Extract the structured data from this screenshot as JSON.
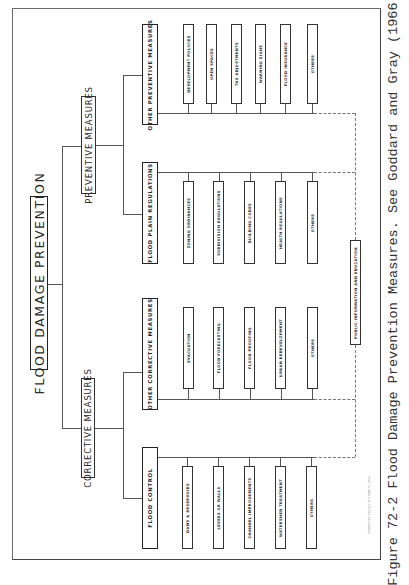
{
  "diagram": {
    "root": {
      "label": "FLOOD DAMAGE PREVENTION"
    },
    "branches": [
      {
        "label": "PREVENTIVE MEASURES",
        "groups": [
          {
            "label": "OTHER PREVENTIVE MEASURES",
            "items": [
              "DEVELOPMENT POLICIES",
              "OPEN SPACES",
              "TAX ADJUSTMENTS",
              "WARNING SIGNS",
              "FLOOD INSURANCE",
              "OTHERS"
            ]
          },
          {
            "label": "FLOOD PLAIN REGULATIONS",
            "items": [
              "ZONING ORDINANCES",
              "SUBDIVISION REGULATIONS",
              "BUILDING CODES",
              "HEALTH REGULATIONS",
              "OTHERS"
            ]
          }
        ]
      },
      {
        "label": "CORRECTIVE MEASURES",
        "groups": [
          {
            "label": "OTHER CORRECTIVE MEASURES",
            "items": [
              "EVACUATION",
              "FLOOD FORECASTING",
              "FLOOD PROOFING",
              "URBAN REDEVELOPMENT",
              "OTHERS"
            ]
          },
          {
            "label": "FLOOD CONTROL",
            "items": [
              "DAMS & RESERVOIRS",
              "LEVEES OR WALLS",
              "CHANNEL IMPROVEMENTS",
              "WATERSHED TREATMENT",
              "OTHERS"
            ]
          }
        ]
      }
    ],
    "shared_node": {
      "label": "PUBLIC INFORMATION AND EDUCATION"
    },
    "credit": "TENNESSEE VALLEY AUTHORITY 1966"
  },
  "caption": "Figure 72-2  Flood Damage Prevention Measures.  See Goddard and Gray (1966)."
}
